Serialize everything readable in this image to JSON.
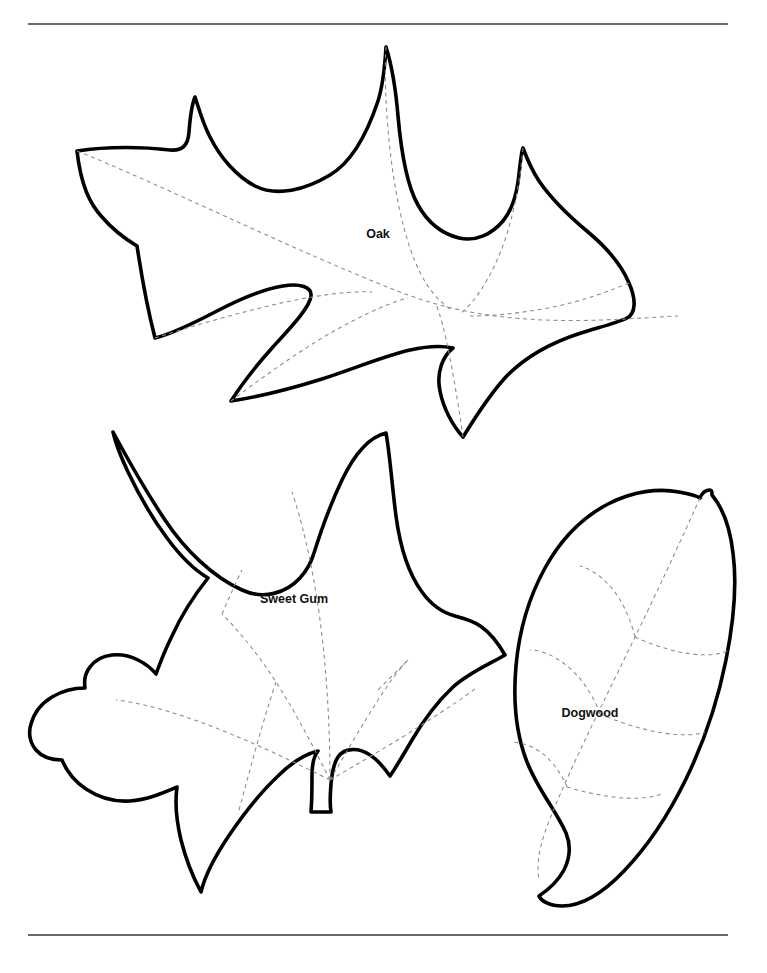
{
  "page": {
    "background_color": "#ffffff",
    "width": 767,
    "height": 973,
    "outline_color": "#000000",
    "vein_color": "#8a8a8a",
    "rule_color": "#3a3a3a"
  },
  "rules": {
    "top": {
      "name": "top-divider",
      "x1": 28,
      "y1": 24,
      "x2": 728,
      "y2": 24
    },
    "bottom": {
      "name": "bottom-divider",
      "x1": 28,
      "y1": 935,
      "x2": 728,
      "y2": 935
    }
  },
  "leaves": [
    {
      "id": "oak",
      "label": "Oak",
      "label_x": 378,
      "label_y": 235,
      "outline": "M 77 151 C 108 146 145 147 170 150 C 182 151 188 146 189 132 C 190 119 192 104 195 97 C 199 109 203 124 210 137 C 220 157 236 176 255 186 C 277 197 305 190 330 175 C 352 162 367 134 378 101 C 383 85 385 64 386 47 C 392 66 396 92 398 116 C 401 150 406 184 418 205 C 428 223 443 234 459 238 C 476 242 492 234 503 221 C 512 210 516 196 518 182 C 520 167 521 152 523 148 C 526 156 531 169 539 181 C 552 200 570 217 588 232 C 606 247 621 264 629 283 C 637 301 635 314 627 318 C 617 323 600 327 581 333 C 553 342 524 357 504 379 C 487 398 473 421 463 437 C 452 425 443 407 440 391 C 436 372 443 356 453 348 C 444 346 428 346 410 350 C 384 356 353 369 322 379 C 290 389 258 397 231 401 C 240 387 255 367 272 348 C 292 326 310 307 311 296 C 312 287 300 283 283 286 C 264 289 240 299 217 311 C 194 323 172 334 155 338 C 144 295 140 264 137 246 C 127 240 114 231 102 217 C 90 204 81 186 77 151 Z",
      "veins": [
        "M 77 151 C 160 184 290 249 400 292 C 500 331 600 320 678 316",
        "M 386 47 C 383 96 390 176 404 228 C 418 280 434 297 450 309",
        "M 523 148 C 520 184 512 226 498 258 C 484 290 470 306 460 314",
        "M 629 283 C 610 291 580 302 548 308 C 516 314 490 316 470 316",
        "M 155 338 C 192 326 248 310 286 302 C 324 294 352 291 372 292",
        "M 231 401 C 256 382 300 350 334 331 C 368 312 392 302 408 298",
        "M 463 437 C 460 416 455 384 450 358 C 445 332 440 314 436 304"
      ]
    },
    {
      "id": "sweet-gum",
      "label": "Sweet Gum",
      "label_x": 294,
      "label_y": 600,
      "outline": "M 113 432 C 127 458 145 490 165 520 C 185 550 213 577 242 590 C 264 600 286 593 300 578 C 308 569 312 560 314 553 C 320 534 330 505 342 480 C 355 453 369 437 386 433 C 390 455 392 486 396 516 C 400 546 408 573 422 592 C 432 606 444 613 455 616 C 469 620 486 622 505 655 C 488 665 468 673 452 688 C 435 704 422 723 412 740 C 402 757 395 769 390 776 C 385 769 378 760 370 755 C 358 747 344 748 338 757 C 334 763 332 772 331 784 C 330 796 330 806 331 812 C 324 812 316 812 311 812 C 312 800 312 786 312 775 C 312 763 314 756 318 751 C 306 754 292 762 278 776 C 262 791 245 812 230 834 C 215 856 205 875 201 892 C 194 879 186 860 181 840 C 176 819 175 801 177 787 C 163 793 147 800 130 801 C 114 802 98 797 86 789 C 74 781 66 770 62 760 C 52 760 42 757 36 750 C 30 743 28 733 31 724 C 34 713 42 703 52 697 C 62 691 74 688 85 688 C 84 681 85 673 90 667 C 95 660 103 656 112 655 C 121 654 130 656 138 660 C 146 664 152 669 156 674 C 160 663 165 650 172 636 C 182 614 196 593 208 578 C 196 571 181 557 167 538 C 152 518 138 493 128 472 C 120 455 115 441 113 432 Z",
      "veins": [
        "M 330 780 C 330 740 328 680 320 620 C 312 560 300 515 292 492",
        "M 330 780 C 318 756 298 716 276 682 C 254 648 234 626 222 614",
        "M 330 780 C 306 768 262 746 216 728 C 170 710 136 702 116 700",
        "M 330 780 C 344 756 364 722 378 700 C 392 678 402 666 408 660",
        "M 330 780 C 354 766 392 744 420 726 C 448 708 466 696 476 688",
        "M 276 682 C 268 706 258 740 251 766 C 244 792 240 806 238 814",
        "M 222 614 C 228 600 236 582 242 570",
        "M 408 660 C 400 668 386 682 376 692"
      ]
    },
    {
      "id": "dogwood",
      "label": "Dogwood",
      "label_x": 590,
      "label_y": 714,
      "outline": "M 712 495 C 722 507 730 527 733 553 C 737 583 734 620 726 660 C 718 700 704 742 686 779 C 668 816 646 848 624 871 C 602 894 580 906 562 906 C 550 906 541 901 539 896 C 548 890 558 881 564 870 C 570 858 571 845 566 833 C 557 812 538 790 527 762 C 516 734 513 700 516 666 C 519 632 529 597 545 568 C 561 539 583 517 608 504 C 633 491 659 488 679 492 C 690 494 697 496 700 498 C 702 493 706 490 710 490 C 712 490 712 492 712 495 Z",
      "veins": [
        "M 700 498 C 690 520 672 560 650 606 C 628 652 604 700 585 740 C 566 780 552 812 545 832 C 538 852 537 868 539 880",
        "M 635 637 C 630 617 621 598 610 586 C 599 574 588 568 580 566",
        "M 635 637 C 652 645 674 652 692 654 C 710 656 722 654 729 650",
        "M 600 714 C 593 694 580 676 566 665 C 552 654 539 650 530 650",
        "M 600 714 C 618 722 643 730 663 733 C 683 736 697 735 705 732",
        "M 567 787 C 560 771 550 758 539 751 C 528 744 518 742 511 742",
        "M 567 787 C 583 792 606 797 624 798 C 642 799 654 797 661 794"
      ]
    }
  ]
}
